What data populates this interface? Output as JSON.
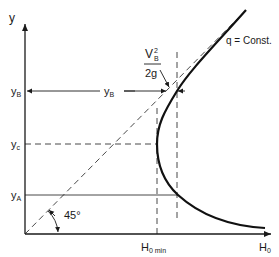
{
  "diagram": {
    "axis_y_label": "y",
    "axis_x_label": "H",
    "axis_x_label_sub": "0",
    "tick_yB": "y",
    "tick_yB_sub": "B",
    "tick_yc": "y",
    "tick_yc_sub": "c",
    "tick_yA": "y",
    "tick_yA_sub": "A",
    "yB_span_label": "y",
    "yB_span_label_sub": "B",
    "h0min_label": "H",
    "h0min_label_sub": "0 min",
    "angle_label": "45°",
    "velocity_head_num": "V",
    "velocity_head_num_sup": "2",
    "velocity_head_num_sub": "B",
    "velocity_head_den": "2g",
    "curve_label": "q = Const.",
    "colors": {
      "ink": "#1a1a1a",
      "background": "#ffffff"
    }
  }
}
